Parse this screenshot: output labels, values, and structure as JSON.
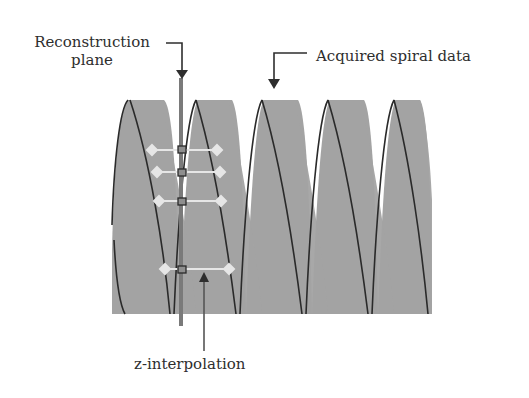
{
  "labels": {
    "reconstruction_plane_line1": "Reconstruction",
    "reconstruction_plane_line2": "plane",
    "acquired_spiral_data": "Acquired spiral data",
    "z_interpolation": "z-interpolation"
  },
  "colors": {
    "spiral_fill": "#a3a3a3",
    "spiral_edge": "#2a2a2a",
    "plane": "#7a7a7a",
    "interp_line": "#e6e6e6",
    "text": "#2e2e2e"
  },
  "spiral": {
    "turns": 5,
    "x_start": 112,
    "x_end": 432,
    "y_top": 100,
    "y_bottom": 314
  },
  "interpolation_points": [
    {
      "y": 150,
      "x_left": 152,
      "x_right": 217
    },
    {
      "y": 172,
      "x_left": 157,
      "x_right": 220
    },
    {
      "y": 201,
      "x_left": 159,
      "x_right": 221
    },
    {
      "y": 269,
      "x_left": 165,
      "x_right": 229
    }
  ]
}
